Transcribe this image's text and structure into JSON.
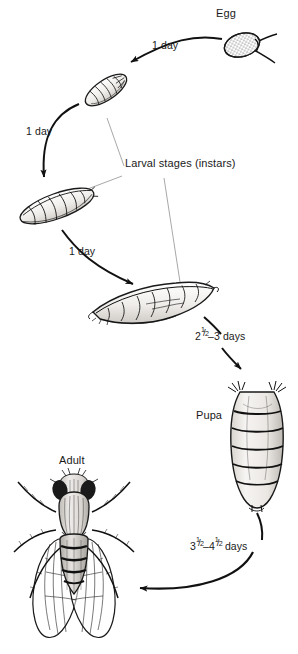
{
  "figure": {
    "background_color": "#ffffff",
    "ink_color": "#111111",
    "leader_line_color": "#6d6d6d"
  },
  "stages": [
    {
      "id": "egg",
      "label": "Egg"
    },
    {
      "id": "larval",
      "label": "Larval stages (instars)"
    },
    {
      "id": "pupa",
      "label": "Pupa"
    },
    {
      "id": "adult",
      "label": "Adult"
    }
  ],
  "durations": [
    {
      "id": "egg-to-first-instar",
      "label": "1 day",
      "from": "egg",
      "to": "first-instar"
    },
    {
      "id": "first-to-second-instar",
      "label": "1 day",
      "from": "first-instar",
      "to": "second-instar"
    },
    {
      "id": "second-to-third-instar",
      "label": "1 day",
      "from": "second-instar",
      "to": "third-instar"
    },
    {
      "id": "third-instar-to-pupa",
      "from": "third-instar",
      "to": "pupa",
      "whole_1": "2",
      "num_1": "1",
      "slash_1": "/",
      "den_1": "2",
      "dash": "–",
      "whole_2": "3",
      "unit": "days"
    },
    {
      "id": "pupa-to-adult",
      "from": "pupa",
      "to": "adult",
      "whole_1": "3",
      "num_1": "1",
      "slash_1": "/",
      "den_1": "2",
      "dash": "–",
      "whole_2": "4",
      "num_2": "1",
      "slash_2": "/",
      "den_2": "2",
      "unit": "days"
    }
  ]
}
